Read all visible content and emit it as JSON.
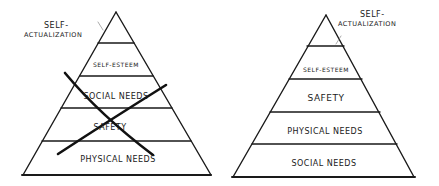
{
  "diagrams": [
    {
      "id": "left",
      "state": "crossed-out",
      "apex_label": "Self-\nActualization",
      "levels_top_to_bottom": [
        "Self-Esteem",
        "Social Needs",
        "Safety",
        "Physical Needs"
      ]
    },
    {
      "id": "right",
      "state": "revised",
      "apex_label": "Self-\nActualization",
      "levels_top_to_bottom": [
        "Self-Esteem",
        "Safety",
        "Physical Needs",
        "Social Needs"
      ]
    }
  ],
  "text": {
    "left_apex_line1": "Self-",
    "left_apex_line2": "Actualization",
    "left_l1": "Self-Esteem",
    "left_l2": "Social Needs",
    "left_l3": "Safety",
    "left_l4": "Physical Needs",
    "right_apex_line1": "Self-",
    "right_apex_line2": "Actualization",
    "right_l1": "Self-Esteem",
    "right_l2": "Safety",
    "right_l3": "Physical Needs",
    "right_l4": "Social Needs"
  },
  "colors": {
    "ink": "#1a1a1a",
    "background": "#ffffff"
  }
}
